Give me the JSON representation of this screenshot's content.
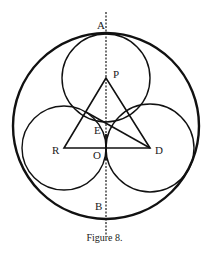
{
  "caption": "Figure 8.",
  "labels": {
    "A": "A",
    "P": "P",
    "E": "E",
    "R": "R",
    "O": "O",
    "D": "D",
    "B": "B"
  },
  "geometry": {
    "outer_circle": {
      "cx": 106,
      "cy": 126,
      "r": 93
    },
    "top_circle": {
      "center": "P",
      "cx": 106,
      "cy": 78,
      "r": 44
    },
    "left_circle": {
      "center": "R",
      "cx": 64,
      "cy": 148,
      "r": 42
    },
    "right_circle": {
      "center": "D",
      "cx": 150,
      "cy": 148,
      "r": 44
    },
    "triangle": [
      "P",
      "R",
      "D"
    ],
    "segment_DE": {
      "from": "D",
      "to_point": [
        86,
        112
      ]
    },
    "dashed_axis": {
      "x": 106,
      "y1": 12,
      "y2": 236
    }
  }
}
